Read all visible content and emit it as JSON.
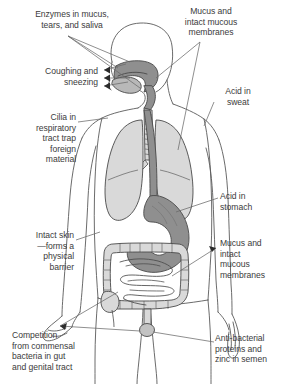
{
  "colors": {
    "text": "#3b3b3b",
    "outline": "#5a5a5a",
    "organ_light": "#d9d9d9",
    "organ_mid": "#b8b8b8",
    "organ_dark": "#8f8f8f",
    "background": "#ffffff"
  },
  "labels": {
    "enzymes": "Enzymes in mucus,\ntears, and saliva",
    "mucus_top": "Mucus and\nintact mucous\nmembranes",
    "coughing": "Coughing and\nsneezing",
    "acid_sweat": "Acid in\nsweat",
    "cilia": "Cilia in\nrespiratory\ntract trap\nforeign\nmaterial",
    "acid_stomach": "Acid in\nstomach",
    "intact_skin": "Intact skin\n—forms a\nphysical\nbarrier",
    "mucus_mid": "Mucus and\nintact\nmucous\nmembranes",
    "competition": "Competition\nfrom commensal\nbacteria in gut\nand genital tract",
    "antibacterial": "Anti-bacterial\nproteins and\nzinc in semen"
  },
  "anatomy": {
    "parts": [
      "head-outline",
      "nasal-cavity",
      "oral-cavity",
      "tongue",
      "pharynx",
      "trachea",
      "left-lung",
      "right-lung",
      "bronchi",
      "esophagus",
      "stomach",
      "large-intestine",
      "small-intestine",
      "torso-outline",
      "left-arm",
      "right-arm",
      "left-hand",
      "right-hand",
      "pelvic-node"
    ]
  }
}
